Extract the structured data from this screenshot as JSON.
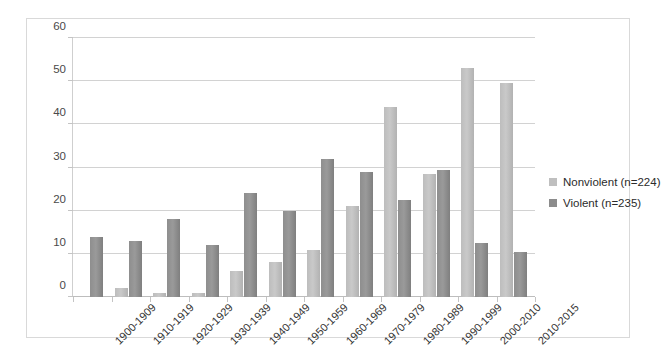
{
  "chart_data": {
    "type": "bar",
    "title": "",
    "xlabel": "",
    "ylabel": "",
    "ylim": [
      0,
      60
    ],
    "y_ticks": [
      0,
      10,
      20,
      30,
      40,
      50,
      60
    ],
    "grid": true,
    "legend_position": "right",
    "categories": [
      "1900-1909",
      "1910-1919",
      "1920-1929",
      "1930-1939",
      "1940-1949",
      "1950-1959",
      "1960-1969",
      "1970-1979",
      "1980-1989",
      "1990-1999",
      "2000-2010",
      "2010-2015"
    ],
    "series": [
      {
        "name": "Nonviolent (n=224)",
        "color": "#bfbfbf",
        "values": [
          0,
          2,
          1,
          1,
          6,
          8,
          11,
          21,
          44,
          28.5,
          53,
          49.5
        ]
      },
      {
        "name": "Violent (n=235)",
        "color": "#8c8c8c",
        "values": [
          14,
          13,
          18,
          12,
          24,
          20,
          32,
          29,
          22.5,
          29.5,
          12.5,
          10.5
        ]
      }
    ]
  }
}
